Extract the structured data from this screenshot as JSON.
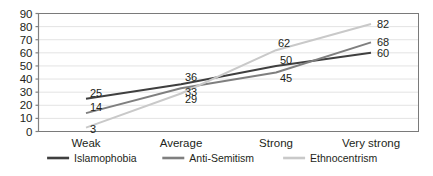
{
  "chart_data": {
    "type": "line",
    "title": "",
    "subtitle": "",
    "xlabel": "",
    "ylabel": "",
    "categories": [
      "Weak",
      "Average",
      "Strong",
      "Very strong"
    ],
    "series": [
      {
        "name": "Islamophobia",
        "values": [
          25,
          36,
          50,
          60
        ],
        "color": "#3f3f3f",
        "icon": "line-swatch-islamophobia"
      },
      {
        "name": "Anti-Semitism",
        "values": [
          14,
          33,
          45,
          68
        ],
        "color": "#7f7f7f",
        "icon": "line-swatch-anti-semitism"
      },
      {
        "name": "Ethnocentrism",
        "values": [
          3,
          29,
          62,
          82
        ],
        "color": "#c9c9c9",
        "icon": "line-swatch-ethnocentrism"
      }
    ],
    "ylim": [
      0,
      90
    ],
    "ytick_step": 10,
    "yticks": [
      "0",
      "10",
      "20",
      "30",
      "40",
      "50",
      "60",
      "70",
      "80",
      "90"
    ],
    "grid": "horizontal",
    "legend_position": "bottom",
    "data_labels_shown": true,
    "plot_border": true,
    "colors": {
      "grid": "#e3e3e3",
      "axis": "#808080",
      "plot_border": "#7a7a7a",
      "text": "#231f20",
      "background": "#ffffff"
    }
  }
}
